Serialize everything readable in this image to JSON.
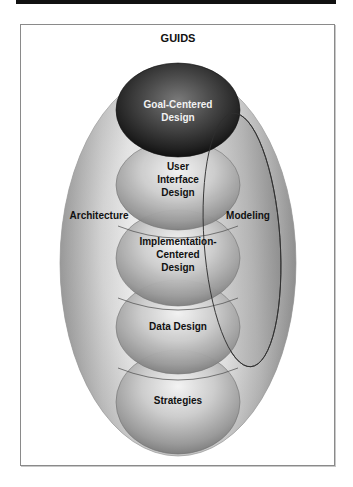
{
  "title": "GUIDS",
  "outer_region": {
    "left_label": "Architecture",
    "right_label": "Modeling"
  },
  "spheres": [
    {
      "id": "goal",
      "lines": [
        "Goal-Centered",
        "Design"
      ],
      "fill": "dark",
      "text_color": "#f2f2f2"
    },
    {
      "id": "ui",
      "lines": [
        "User",
        "Interface",
        "Design"
      ],
      "fill": "light"
    },
    {
      "id": "impl",
      "lines": [
        "Implementation-",
        "Centered",
        "Design"
      ],
      "fill": "light"
    },
    {
      "id": "data",
      "lines": [
        "Data Design"
      ],
      "fill": "light"
    },
    {
      "id": "strategies",
      "lines": [
        "Strategies"
      ],
      "fill": "light"
    }
  ],
  "colors": {
    "top_bar": "#111111",
    "frame_border": "#8a8a8a",
    "dark_sphere": "#2a2a2a",
    "light_sphere": "#bdbdbd",
    "outer_shell": "#a8a8a8"
  }
}
